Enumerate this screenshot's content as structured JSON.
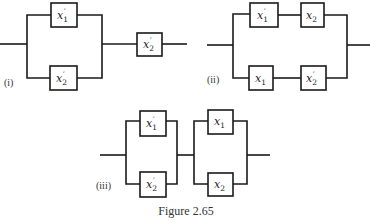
{
  "figure": {
    "caption": "Figure 2.65",
    "diagrams": [
      {
        "label": "(i)",
        "structure": "parallel(x1', x2') in series with x2'",
        "parallel_top": {
          "var": "x",
          "sub": "1",
          "prime": "′"
        },
        "parallel_bottom": {
          "var": "x",
          "sub": "2",
          "prime": "′"
        },
        "series": {
          "var": "x",
          "sub": "2",
          "prime": "′"
        }
      },
      {
        "label": "(ii)",
        "structure": "parallel(series(x1', x2), series(x1, x2'))",
        "top_first": {
          "var": "x",
          "sub": "1",
          "prime": "′"
        },
        "top_second": {
          "var": "x",
          "sub": "2",
          "prime": ""
        },
        "bottom_first": {
          "var": "x",
          "sub": "1",
          "prime": ""
        },
        "bottom_second": {
          "var": "x",
          "sub": "2",
          "prime": "′"
        }
      },
      {
        "label": "(iii)",
        "structure": "parallel(x1', x2') in series with parallel(x1, x2)",
        "left_top": {
          "var": "x",
          "sub": "1",
          "prime": "′"
        },
        "left_bottom": {
          "var": "x",
          "sub": "2",
          "prime": "′"
        },
        "right_top": {
          "var": "x",
          "sub": "1",
          "prime": ""
        },
        "right_bottom": {
          "var": "x",
          "sub": "2",
          "prime": ""
        }
      }
    ]
  }
}
